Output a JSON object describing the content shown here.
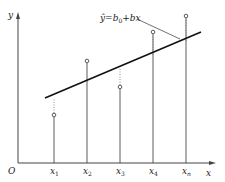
{
  "diagram": {
    "axes": {
      "x_label": "x",
      "y_label": "y",
      "origin_label": "O"
    },
    "ticks": [
      {
        "base": "x",
        "sub": "1"
      },
      {
        "base": "x",
        "sub": "2"
      },
      {
        "base": "x",
        "sub": "3"
      },
      {
        "base": "x",
        "sub": "4"
      },
      {
        "base": "x",
        "sub": "n"
      }
    ],
    "equation": {
      "lhs": "ŷ",
      "eq": "=",
      "b": "b",
      "sub0": "0",
      "rest": "+bx"
    },
    "colors": {
      "line": "#222222",
      "axis": "#555555",
      "dotted": "#888888"
    }
  }
}
